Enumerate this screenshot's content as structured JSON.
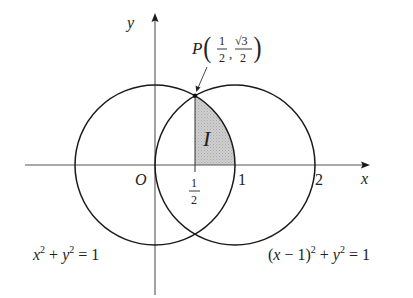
{
  "diagram": {
    "type": "geometry-plot",
    "axes": {
      "x_label": "x",
      "y_label": "y",
      "origin_label": "O",
      "x_ticks": [
        {
          "value": 0.5,
          "numerator": "1",
          "denominator": "2"
        },
        {
          "value": 1,
          "label": "1"
        },
        {
          "value": 2,
          "label": "2"
        }
      ]
    },
    "circles": [
      {
        "name": "left-circle",
        "center": [
          0,
          0
        ],
        "radius": 1,
        "equation": {
          "base": "x",
          "exp1": "2",
          "plus": " + ",
          "var2": "y",
          "exp2": "2",
          "rhs": " = 1"
        }
      },
      {
        "name": "right-circle",
        "center": [
          1,
          0
        ],
        "radius": 1,
        "equation": {
          "prefix": "(",
          "base": "x",
          "minus": " − 1)",
          "exp1": "2",
          "plus": " + ",
          "var2": "y",
          "exp2": "2",
          "rhs": " = 1"
        }
      }
    ],
    "point": {
      "name": "P",
      "x": {
        "numerator": "1",
        "denominator": "2"
      },
      "y": {
        "numerator": "√3",
        "denominator": "2"
      }
    },
    "region": {
      "label": "I",
      "fill": "#c8c8c8"
    },
    "colors": {
      "stroke": "#1a1a1a",
      "axis": "#555555",
      "text": "#222222"
    }
  }
}
